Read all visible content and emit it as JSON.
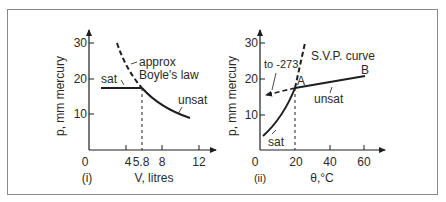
{
  "figure": {
    "panels": [
      {
        "id": "i",
        "caption": "(i)",
        "y_axis_label": "p, mm mercury",
        "x_axis_label": "V, litres",
        "y_ticks": [
          "10",
          "20",
          "30"
        ],
        "x_ticks": [
          "0",
          "4",
          "5.8",
          "8",
          "12"
        ],
        "annotations": {
          "sat": "sat",
          "unsat": "unsat",
          "boyle_line1": "approx",
          "boyle_line2": "Boyle's law"
        }
      },
      {
        "id": "ii",
        "caption": "(ii)",
        "y_axis_label": "p, mm mercury",
        "x_axis_label": "θ,°C",
        "y_ticks": [
          "10",
          "20",
          "30"
        ],
        "x_ticks": [
          "0",
          "20",
          "40",
          "60"
        ],
        "annotations": {
          "svp": "S.V.P. curve",
          "to_abs_zero": "to -273",
          "point_a": "A",
          "point_b": "B",
          "unsat": "unsat",
          "sat": "sat"
        }
      }
    ],
    "colors": {
      "line": "#1e1e1e",
      "text": "#2a2a2a",
      "frame": "#8a8a8a"
    }
  }
}
